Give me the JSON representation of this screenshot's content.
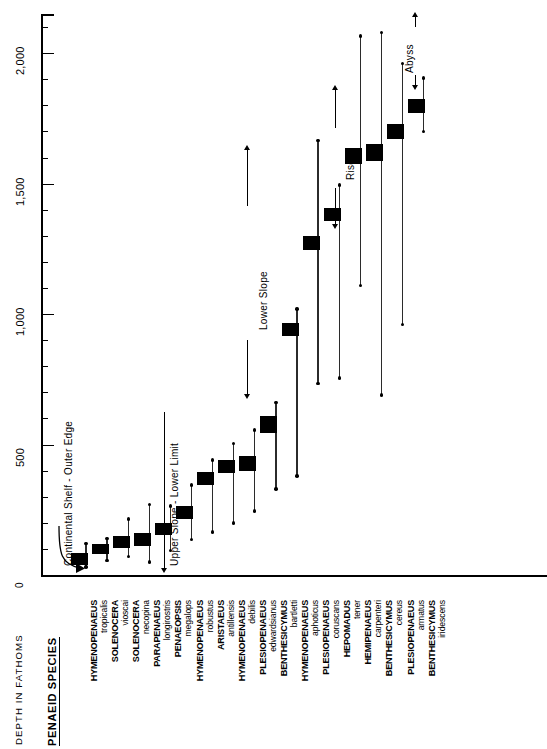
{
  "figure": {
    "depth_axis_title": "DEPTH  IN  FATHOMS",
    "zero_label": "0",
    "species_heading": "PENAEID SPECIES"
  },
  "annotations": [
    {
      "id": "continental-shelf",
      "label": "Continental  Shelf - Outer Edge",
      "marker": "curved-arrow"
    },
    {
      "id": "upper-slope",
      "label": "Upper Slope - Lower Limit",
      "marker": "single-arrow"
    },
    {
      "id": "lower-slope",
      "label": "Lower  Slope",
      "marker": "double-arrow"
    },
    {
      "id": "rise",
      "label": "Rise",
      "marker": "double-arrow"
    },
    {
      "id": "abyss",
      "label": "Abyss",
      "marker": "double-arrow"
    }
  ],
  "chart_data": {
    "type": "bar",
    "orientation": "vertical-rotated",
    "xlabel": "PENAEID SPECIES",
    "ylabel": "DEPTH  IN  FATHOMS",
    "ylim": [
      0,
      2150
    ],
    "yticks": [
      0,
      500,
      1000,
      1500,
      2000
    ],
    "ytick_labels": [
      "0",
      "500",
      "1,000",
      "1,500",
      "2,000"
    ],
    "minor_tick_interval": 100,
    "grid": false,
    "legend": null,
    "value_unit": "fathoms",
    "series_description": "Thin line = total observed depth range (dots mark minimum and maximum). Thick horizontal bar = depth of greatest abundance.",
    "categories": [
      "HYMENOPENAEUS tropicalis",
      "SOLENOCERA vioscai",
      "SOLENOCERA necopina",
      "PARAPENAEUS longirostris",
      "PENAEOPSIS megalops",
      "HYMENOPENAEUS robustus",
      "ARISTAEUS antillensis",
      "HYMENOPENAEUS debilis",
      "PLESIOPENAEUS edwardsianus",
      "BENTHESICYMUS bartletti",
      "HYMENOPENAEUS aphoticus",
      "PLESIOPENAEUS coruscans",
      "HEPOMADUS tener",
      "HEMIPENAEUS carpenteri",
      "BENTHESICYMUS cereus",
      "PLESIOPENAEUS armatus",
      "BENTHESICYMUS iridescens"
    ],
    "species": [
      {
        "genus": "HYMENOPENAEUS",
        "epithet": "tropicalis",
        "min": 30,
        "max": 120,
        "mode_low": 40,
        "mode_high": 85
      },
      {
        "genus": "SOLENOCERA",
        "epithet": "vioscai",
        "min": 55,
        "max": 140,
        "mode_low": 80,
        "mode_high": 120
      },
      {
        "genus": "SOLENOCERA",
        "epithet": "necopina",
        "min": 70,
        "max": 215,
        "mode_low": 105,
        "mode_high": 150
      },
      {
        "genus": "PARAPENAEUS",
        "epithet": "longirostris",
        "min": 50,
        "max": 270,
        "mode_low": 110,
        "mode_high": 160
      },
      {
        "genus": "PENAEOPSIS",
        "epithet": "megalops",
        "min": 95,
        "max": 265,
        "mode_low": 155,
        "mode_high": 200
      },
      {
        "genus": "HYMENOPENAEUS",
        "epithet": "robustus",
        "min": 135,
        "max": 345,
        "mode_low": 215,
        "mode_high": 265
      },
      {
        "genus": "ARISTAEUS",
        "epithet": "antillensis",
        "min": 165,
        "max": 440,
        "mode_low": 345,
        "mode_high": 395
      },
      {
        "genus": "HYMENOPENAEUS",
        "epithet": "debilis",
        "min": 200,
        "max": 505,
        "mode_low": 390,
        "mode_high": 440
      },
      {
        "genus": "PLESIOPENAEUS",
        "epithet": "edwardsianus",
        "min": 245,
        "max": 555,
        "mode_low": 400,
        "mode_high": 455
      },
      {
        "genus": "BENTHESICYMUS",
        "epithet": "bartletti",
        "min": 330,
        "max": 660,
        "mode_low": 545,
        "mode_high": 610
      },
      {
        "genus": "HYMENOPENAEUS",
        "epithet": "aphoticus",
        "min": 380,
        "max": 1020,
        "mode_low": 915,
        "mode_high": 965
      },
      {
        "genus": "PLESIOPENAEUS",
        "epithet": "coruscans",
        "min": 735,
        "max": 1665,
        "mode_low": 1245,
        "mode_high": 1300
      },
      {
        "genus": "HEPOMADUS",
        "epithet": "tener",
        "min": 755,
        "max": 1495,
        "mode_low": 1355,
        "mode_high": 1405
      },
      {
        "genus": "HEMIPENAEUS",
        "epithet": "carpenteri",
        "min": 1110,
        "max": 2065,
        "mode_low": 1575,
        "mode_high": 1635
      },
      {
        "genus": "BENTHESICYMUS",
        "epithet": "cereus",
        "min": 690,
        "max": 2080,
        "mode_low": 1585,
        "mode_high": 1650
      },
      {
        "genus": "PLESIOPENAEUS",
        "epithet": "armatus",
        "min": 960,
        "max": 1960,
        "mode_low": 1670,
        "mode_high": 1730
      },
      {
        "genus": "BENTHESICYMUS",
        "epithet": "iridescens",
        "min": 1700,
        "max": 1905,
        "mode_low": 1770,
        "mode_high": 1825
      }
    ],
    "extra_labels": [
      "HYMENOPENAEUS tropicalis",
      "SOLENOCERA vioscai",
      "SOLENOCERA necopina",
      "PARAPENAEUS longirostris",
      "PENAEOPSIS megalops",
      "HYMENOPENAEUS robustus",
      "ARISTAEUS antillensis",
      "HYMENOPENAEUS debilis",
      "PLESIOPENAEUS edwardsianus",
      "BENTHESICYMUS edwardsianus",
      "BENTHESICYMUS bartletti",
      "HYMENOPENAEUS aphoticus",
      "PLESIOPENAEUS coruscans",
      "HEPOMADUS tener",
      "HEMIPENAEUS carpenteri",
      "BENTHESICYMUS cereus",
      "PLESIOPENAEUS armatus",
      "BENTHESICYMUS iridescens"
    ]
  },
  "label_column": [
    {
      "genus": "HYMENOPENAEUS",
      "epithet": "tropicalis"
    },
    {
      "genus": "SOLENOCERA",
      "epithet": "vioscai"
    },
    {
      "genus": "SOLENOCERA",
      "epithet": "necopina"
    },
    {
      "genus": "PARAPENAEUS",
      "epithet": "longirostris"
    },
    {
      "genus": "PENAEOPSIS",
      "epithet": "megalops"
    },
    {
      "genus": "HYMENOPENAEUS",
      "epithet": "robustus"
    },
    {
      "genus": "ARISTAEUS",
      "epithet": "antillensis"
    },
    {
      "genus": "HYMENOPENAEUS",
      "epithet": "debilis"
    },
    {
      "genus": "PLESIOPENAEUS",
      "epithet": "edwardsianus"
    },
    {
      "genus": "BENTHESICYMUS",
      "epithet": "bartletti"
    },
    {
      "genus": "HYMENOPENAEUS",
      "epithet": "aphoticus"
    },
    {
      "genus": "PLESIOPENAEUS",
      "epithet": "coruscans"
    },
    {
      "genus": "HEPOMADUS",
      "epithet": "tener"
    },
    {
      "genus": "HEMIPENAEUS",
      "epithet": "carpenteri"
    },
    {
      "genus": "BENTHESICYMUS",
      "epithet": "cereus"
    },
    {
      "genus": "PLESIOPENAEUS",
      "epithet": "armatus"
    },
    {
      "genus": "BENTHESICYMUS",
      "epithet": "iridescens"
    }
  ]
}
